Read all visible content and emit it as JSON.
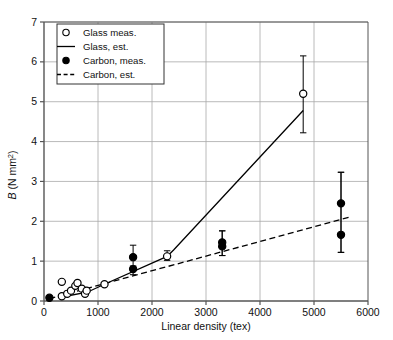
{
  "chart_data": {
    "type": "scatter",
    "title": "",
    "xlabel": "Linear density (tex)",
    "ylabel": "B (N mm2)",
    "ylabel_symbol": "B",
    "ylabel_units": " (N mm",
    "ylabel_exponent": "2",
    "ylabel_close": ")",
    "xlim": [
      0,
      6000
    ],
    "ylim": [
      0,
      7
    ],
    "xticks": [
      0,
      1000,
      2000,
      3000,
      4000,
      5000,
      6000
    ],
    "yticks": [
      0,
      1,
      2,
      3,
      4,
      5,
      6,
      7
    ],
    "xtick_labels": [
      "0",
      "1000",
      "2000",
      "3000",
      "4000",
      "5000",
      "6000"
    ],
    "ytick_labels": [
      "0",
      "1",
      "2",
      "3",
      "4",
      "5",
      "6",
      "7"
    ],
    "grid": "horizontal-and-vertical",
    "grid_color": "#a8a8a8",
    "axis_color": "#555555",
    "series_color": "#000000",
    "legend_position": "top-left",
    "legend": [
      {
        "label": "Glass meas.",
        "marker": "open-circle"
      },
      {
        "label": "Glass, est.",
        "marker": "solid-line"
      },
      {
        "label": "Carbon, meas.",
        "marker": "filled-circle"
      },
      {
        "label": "Carbon, est.",
        "marker": "dashed-line"
      }
    ],
    "series": [
      {
        "name": "Glass meas.",
        "marker": "open-circle",
        "points": [
          {
            "x": 330,
            "y": 0.48
          },
          {
            "x": 330,
            "y": 0.12
          },
          {
            "x": 430,
            "y": 0.18
          },
          {
            "x": 500,
            "y": 0.26
          },
          {
            "x": 580,
            "y": 0.38
          },
          {
            "x": 620,
            "y": 0.45
          },
          {
            "x": 700,
            "y": 0.31
          },
          {
            "x": 760,
            "y": 0.18
          },
          {
            "x": 790,
            "y": 0.26
          },
          {
            "x": 1120,
            "y": 0.42
          },
          {
            "x": 2280,
            "y": 1.12,
            "yerr_low": 1.02,
            "yerr_high": 1.26
          },
          {
            "x": 4800,
            "y": 5.2,
            "yerr_low": 4.22,
            "yerr_high": 6.15
          }
        ]
      },
      {
        "name": "Carbon, meas.",
        "marker": "filled-circle",
        "points": [
          {
            "x": 100,
            "y": 0.08
          },
          {
            "x": 1650,
            "y": 1.1,
            "yerr_low": 0.86,
            "yerr_high": 1.4
          },
          {
            "x": 1650,
            "y": 0.8,
            "yerr_low": 0.66,
            "yerr_high": 0.88
          },
          {
            "x": 3300,
            "y": 1.47,
            "yerr_low": 1.14,
            "yerr_high": 1.76
          },
          {
            "x": 3300,
            "y": 1.37,
            "yerr_low": 1.14,
            "yerr_high": 1.76
          },
          {
            "x": 5500,
            "y": 2.45,
            "yerr_low": 1.22,
            "yerr_high": 3.23
          },
          {
            "x": 5500,
            "y": 1.66,
            "yerr_low": 1.22,
            "yerr_high": 3.23
          }
        ]
      },
      {
        "name": "Glass, est.",
        "style": "solid-line",
        "points": [
          {
            "x": 330,
            "y": 0.1
          },
          {
            "x": 800,
            "y": 0.22
          },
          {
            "x": 1120,
            "y": 0.42
          },
          {
            "x": 2280,
            "y": 1.12
          },
          {
            "x": 2400,
            "y": 1.28
          },
          {
            "x": 4800,
            "y": 4.78
          }
        ]
      },
      {
        "name": "Carbon, est.",
        "style": "dashed-line",
        "points": [
          {
            "x": 100,
            "y": 0.06
          },
          {
            "x": 5700,
            "y": 2.12
          }
        ]
      }
    ]
  }
}
